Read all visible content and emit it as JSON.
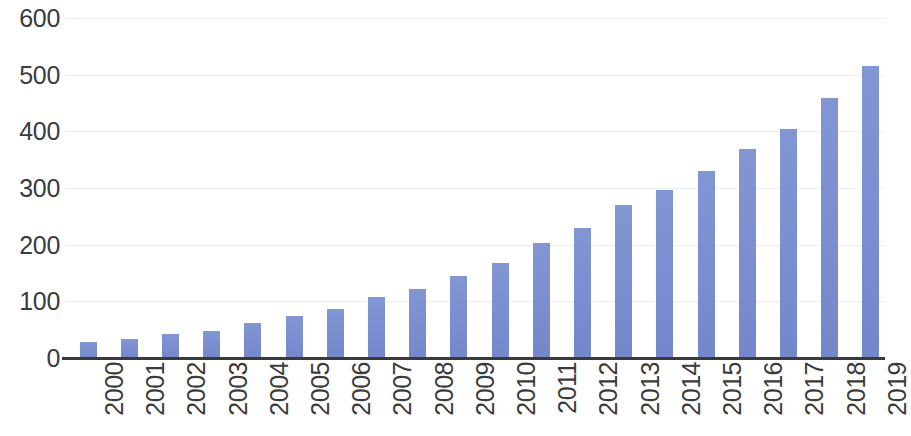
{
  "chart_data": {
    "type": "bar",
    "title": "",
    "subtitle": "",
    "xlabel": "",
    "ylabel": "",
    "categories": [
      "2000",
      "2001",
      "2002",
      "2003",
      "2004",
      "2005",
      "2006",
      "2007",
      "2008",
      "2009",
      "2010",
      "2011",
      "2012",
      "2013",
      "2014",
      "2015",
      "2016",
      "2017",
      "2018",
      "2019"
    ],
    "values": [
      28,
      33,
      42,
      48,
      61,
      74,
      86,
      108,
      121,
      145,
      167,
      203,
      229,
      270,
      296,
      330,
      368,
      404,
      459,
      516
    ],
    "series": [
      {
        "name": "",
        "values": [
          28,
          33,
          42,
          48,
          61,
          74,
          86,
          108,
          121,
          145,
          167,
          203,
          229,
          270,
          296,
          330,
          368,
          404,
          459,
          516
        ]
      }
    ],
    "ylim": [
      0,
      600
    ],
    "y_ticks": [
      0,
      100,
      200,
      300,
      400,
      500,
      600
    ],
    "y_tick_labels": [
      "0",
      "100",
      "200",
      "300",
      "400",
      "500",
      "600"
    ],
    "x_tick_labels": [
      "2000",
      "2001",
      "2002",
      "2003",
      "2004",
      "2005",
      "2006",
      "2007",
      "2008",
      "2009",
      "2010",
      "2011",
      "2012",
      "2013",
      "2014",
      "2015",
      "2016",
      "2017",
      "2018",
      "2019"
    ],
    "x_tick_rotation": 90,
    "grid": true,
    "grid_axis": "y",
    "legend": false,
    "legend_position": "none",
    "annotations": [],
    "colors": {
      "bar": "#7b8fd0",
      "gridline": "#e9eef7",
      "axis": "#3a3a3a",
      "tick_label": "#3b3b3b",
      "background": "#ffffff"
    }
  }
}
